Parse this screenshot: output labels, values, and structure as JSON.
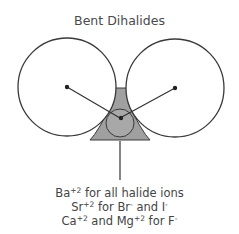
{
  "title": "Bent Dihalides",
  "diagram": {
    "halide_circle_left": {
      "cx": 67,
      "cy": 87,
      "r": 49
    },
    "halide_circle_right": {
      "cx": 175,
      "cy": 88,
      "r": 49
    },
    "metal_circle": {
      "cx": 120,
      "cy": 118,
      "r": 13
    },
    "colors": {
      "stroke": "#3a3a3a",
      "shade": "#9a9a9a",
      "metal_fill": "#a8a8a8",
      "dot": "#222222"
    }
  },
  "caption": {
    "line1": {
      "ion": "Ba",
      "charge": "+2",
      "rest": " for all halide ions"
    },
    "line2": {
      "ion": "Sr",
      "charge": "+2",
      "mid": " for Br",
      "mid_charge": "-",
      "rest": " and I",
      "rest_charge": "-"
    },
    "line3": {
      "ion": "Ca",
      "charge": "+2",
      "mid": " and Mg",
      "mid_charge": "+2",
      "rest": " for F",
      "rest_charge": "-"
    }
  }
}
